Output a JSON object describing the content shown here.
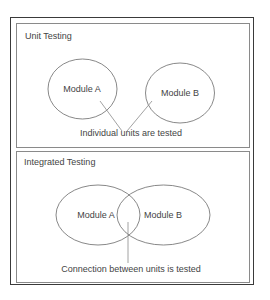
{
  "panels": {
    "unit": {
      "title": "Unit Testing",
      "modules": [
        "Module A",
        "Module B"
      ],
      "caption": "Individual units are tested"
    },
    "integrated": {
      "title": "Integrated Testing",
      "modules": [
        "Module A",
        "Module B"
      ],
      "caption": "Connection between units is tested"
    }
  },
  "colors": {
    "outer_border": "#3a3a3a",
    "panel_border": "#8a8a8a",
    "shape_stroke": "#6a6a6a",
    "text": "#444444"
  }
}
